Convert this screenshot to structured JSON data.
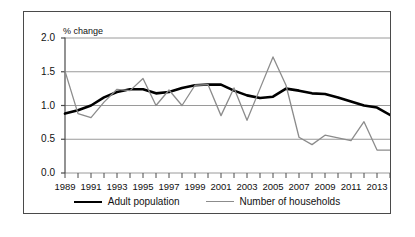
{
  "chart_data": {
    "type": "line",
    "title": "",
    "subtitle": "",
    "ylabel": "% change",
    "xlabel": "",
    "ylim": [
      0.0,
      2.0
    ],
    "ytick_values": [
      0.0,
      0.5,
      1.0,
      1.5,
      2.0
    ],
    "ytick_labels": [
      "0.0",
      "0.5",
      "1.0",
      "1.5",
      "2.0"
    ],
    "grid": true,
    "legend_position": "bottom",
    "x": [
      1989,
      1990,
      1991,
      1992,
      1993,
      1994,
      1995,
      1996,
      1997,
      1998,
      1999,
      2000,
      2001,
      2002,
      2003,
      2004,
      2005,
      2006,
      2007,
      2008,
      2009,
      2010,
      2011,
      2012,
      2013,
      2014
    ],
    "xtick_labels": [
      "1989",
      "1991",
      "1993",
      "1995",
      "1997",
      "1999",
      "2001",
      "2003",
      "2005",
      "2007",
      "2009",
      "2011",
      "2013"
    ],
    "series": [
      {
        "name": "Adult population",
        "color": "#000000",
        "values": [
          0.88,
          0.93,
          1.0,
          1.12,
          1.2,
          1.24,
          1.24,
          1.18,
          1.2,
          1.26,
          1.3,
          1.31,
          1.31,
          1.22,
          1.15,
          1.11,
          1.13,
          1.25,
          1.22,
          1.18,
          1.17,
          1.12,
          1.06,
          1.0,
          0.97,
          0.86
        ]
      },
      {
        "name": "Number of households",
        "color": "#8c8c8c",
        "values": [
          1.51,
          0.88,
          0.82,
          1.05,
          1.24,
          1.22,
          1.4,
          1.0,
          1.23,
          1.0,
          1.3,
          1.31,
          0.85,
          1.26,
          0.78,
          1.25,
          1.72,
          1.3,
          0.53,
          0.42,
          0.56,
          0.52,
          0.48,
          0.76,
          0.34,
          0.34
        ]
      }
    ]
  },
  "legend": {
    "entries": [
      {
        "label": "Adult population"
      },
      {
        "label": "Number of households"
      }
    ]
  }
}
